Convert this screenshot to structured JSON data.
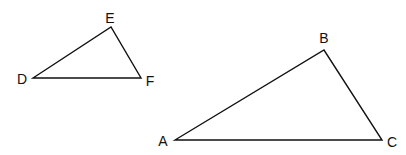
{
  "diagram": {
    "triangles": [
      {
        "name": "DEF",
        "vertices": [
          {
            "id": "D",
            "label": "D"
          },
          {
            "id": "E",
            "label": "E"
          },
          {
            "id": "F",
            "label": "F"
          }
        ]
      },
      {
        "name": "ABC",
        "vertices": [
          {
            "id": "A",
            "label": "A"
          },
          {
            "id": "B",
            "label": "B"
          },
          {
            "id": "C",
            "label": "C"
          }
        ]
      }
    ]
  }
}
